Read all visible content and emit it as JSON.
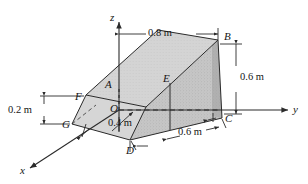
{
  "figure": {
    "axes": {
      "x": "x",
      "y": "y",
      "z": "z"
    },
    "origin_label": "O",
    "vertices": [
      "A",
      "B",
      "C",
      "D",
      "E",
      "F",
      "G"
    ],
    "vertex_labels": {
      "A": "A",
      "B": "B",
      "C": "C",
      "D": "D",
      "E": "E",
      "F": "F",
      "G": "G"
    },
    "dimensions": [
      {
        "name": "top-width",
        "value": "0.8 m"
      },
      {
        "name": "right-height",
        "value": "0.6 m"
      },
      {
        "name": "bottom-depth",
        "value": "0.6 m"
      },
      {
        "name": "origin-offset",
        "value": "0.4 m"
      },
      {
        "name": "left-height",
        "value": "0.2 m"
      }
    ],
    "colors": {
      "line": "#2b2b2b",
      "face_light": "#d2d2d2",
      "face_mid": "#c2c2c2",
      "face_dark": "#a9a9a9",
      "background": "#ffffff"
    }
  }
}
